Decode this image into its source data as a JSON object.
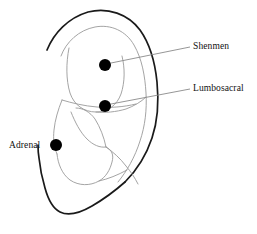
{
  "diagram": {
    "background_color": "#ffffff",
    "outline_color": "#1a1a1a",
    "inner_line_color": "#9a9a9a",
    "point_color": "#000000",
    "leader_color": "#8a8a8a",
    "text_color": "#111111",
    "width": 257,
    "height": 234
  },
  "points": [
    {
      "id": "shenmen",
      "label": "Shenmen",
      "x": 105,
      "y": 65,
      "radius": 6,
      "leader": {
        "x1": 111,
        "y1": 63,
        "x2": 190,
        "y2": 47
      },
      "label_x": 193,
      "label_y": 42
    },
    {
      "id": "lumbosacral",
      "label": "Lumbosacral",
      "x": 105,
      "y": 106,
      "radius": 6,
      "leader": {
        "x1": 111,
        "y1": 104,
        "x2": 190,
        "y2": 89
      },
      "label_x": 193,
      "label_y": 84
    },
    {
      "id": "adrenal",
      "label": "Adrenal",
      "x": 56,
      "y": 145,
      "radius": 6,
      "leader": null,
      "label_x": 9,
      "label_y": 141
    }
  ],
  "anatomy": {
    "helix_label": "helix-outline",
    "antihelix_label": "antihelix-outline",
    "concha_label": "concha-outline",
    "lobe_label": "earlobe-outline",
    "tragus_label": "tragus-outline"
  }
}
